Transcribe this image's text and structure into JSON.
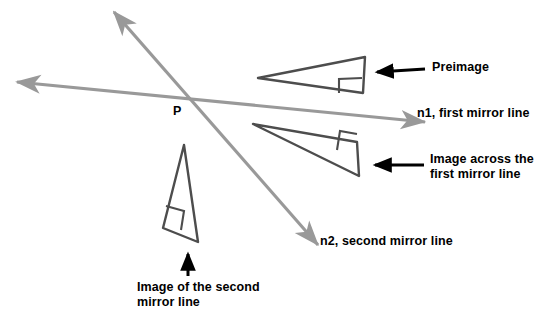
{
  "figure": {
    "title_text": "",
    "background_color": "#ffffff",
    "width": 547,
    "height": 324
  },
  "colors": {
    "mirror_line": "#999999",
    "triangle_stroke": "#4d4d4d",
    "pointer_arrow": "#000000",
    "text": "#000000"
  },
  "labels": {
    "point_p": "P",
    "preimage": "Preimage",
    "mirror_line_1": "n1, first mirror line",
    "image_across_first_line": "Image across the\nfirst mirror line",
    "mirror_line_2": "n2, second mirror line",
    "image_of_second_line": "Image of the second\nmirror line"
  },
  "geometry": {
    "intersection_point": {
      "name": "P",
      "x": 190,
      "y": 97
    },
    "mirror_lines": [
      {
        "name": "n1",
        "label": "n1, first mirror line",
        "x1": 17,
        "y1": 82,
        "x2": 425,
        "y2": 122,
        "double_headed": true
      },
      {
        "name": "n2",
        "label": "n2, second mirror line",
        "x1": 114,
        "y1": 12,
        "x2": 318,
        "y2": 245,
        "double_headed": true
      }
    ],
    "triangles": [
      {
        "name": "preimage",
        "points": "258,78 365,57 363,93",
        "right_angle_at": "363,93",
        "right_angle_mark": "339,93 339,79 362,78"
      },
      {
        "name": "image-across-first-mirror-line",
        "points": "253,124 357,142 359,176",
        "right_angle_at": "357,142",
        "right_angle_mark": "337,150 340,131 357,134"
      },
      {
        "name": "image-of-second-mirror-line",
        "points": "184,145 163,228 198,242",
        "right_angle_at": "163,228",
        "right_angle_mark": "166,206 184,211 181,230"
      }
    ],
    "pointer_arrows": [
      {
        "name": "preimage-pointer",
        "x1": 425,
        "y1": 69,
        "x2": 374,
        "y2": 72
      },
      {
        "name": "image-n1-pointer",
        "x1": 424,
        "y1": 165,
        "x2": 371,
        "y2": 165
      },
      {
        "name": "image-n2-pointer",
        "x1": 188,
        "y1": 276,
        "x2": 188,
        "y2": 250
      }
    ]
  }
}
